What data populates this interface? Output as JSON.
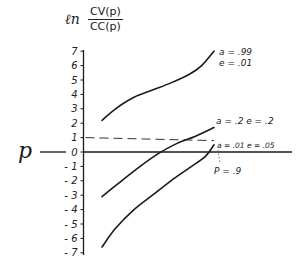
{
  "chart_data": {
    "type": "line",
    "title": "",
    "ylabel": {
      "prefix": "ln",
      "numerator": "CV(p)",
      "denominator": "CC(p)"
    },
    "xlabel": "p",
    "ylim": [
      -7,
      7
    ],
    "yticks": [
      7,
      6,
      5,
      4,
      3,
      2,
      1,
      0,
      -1,
      -2,
      -3,
      -4,
      -5,
      -6,
      -7
    ],
    "ytick_labels": [
      "7",
      "6",
      "5",
      "4",
      "3",
      "2",
      "1",
      "0",
      "- 1",
      "- 2",
      "- 3",
      "- 4",
      "- 5",
      "- 6",
      "- 7"
    ],
    "grid": false,
    "xlim": [
      0,
      1
    ],
    "series": [
      {
        "name": "a = .99  e = .01",
        "label_lines": [
          "a = .99",
          "e = .01"
        ],
        "x": [
          0.09,
          0.2,
          0.35,
          0.5,
          0.65,
          0.8,
          0.9,
          1.0
        ],
        "y": [
          2.2,
          3.0,
          3.8,
          4.3,
          4.8,
          5.4,
          6.0,
          7.0
        ]
      },
      {
        "name": "a = .2  e = .2",
        "label_lines": [
          "a = .2   e = .2"
        ],
        "x": [
          0.09,
          0.25,
          0.4,
          0.55,
          0.7,
          0.85,
          1.0
        ],
        "y": [
          -3.1,
          -2.0,
          -1.0,
          -0.1,
          0.6,
          1.1,
          1.7
        ]
      },
      {
        "name": "a = .01  e = .05",
        "label_lines": [
          "a = .01   e = .05"
        ],
        "x": [
          0.09,
          0.2,
          0.35,
          0.5,
          0.65,
          0.8,
          0.93,
          1.0
        ],
        "y": [
          -6.6,
          -5.3,
          -4.0,
          -3.0,
          -2.0,
          -1.1,
          -0.3,
          0.5
        ]
      }
    ],
    "annotations": [
      {
        "type": "dashed-hline",
        "y": 1,
        "x_from": 0,
        "x_to": 1.0
      },
      {
        "type": "dotted-vline",
        "label": "P = .9"
      }
    ]
  },
  "text": {
    "ln": "ℓn",
    "numerator": "CV(p)",
    "denominator": "CC(p)",
    "x_axis_label": "p",
    "p_marker": "P = .9"
  }
}
